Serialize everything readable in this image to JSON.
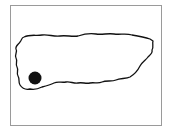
{
  "map": {
    "subject": "Puerto Rico locator map",
    "frame_color": "#9a9a9a",
    "outline_color": "#111111",
    "marker": {
      "label": "location-marker",
      "position": "southwest",
      "color": "#111111"
    }
  }
}
